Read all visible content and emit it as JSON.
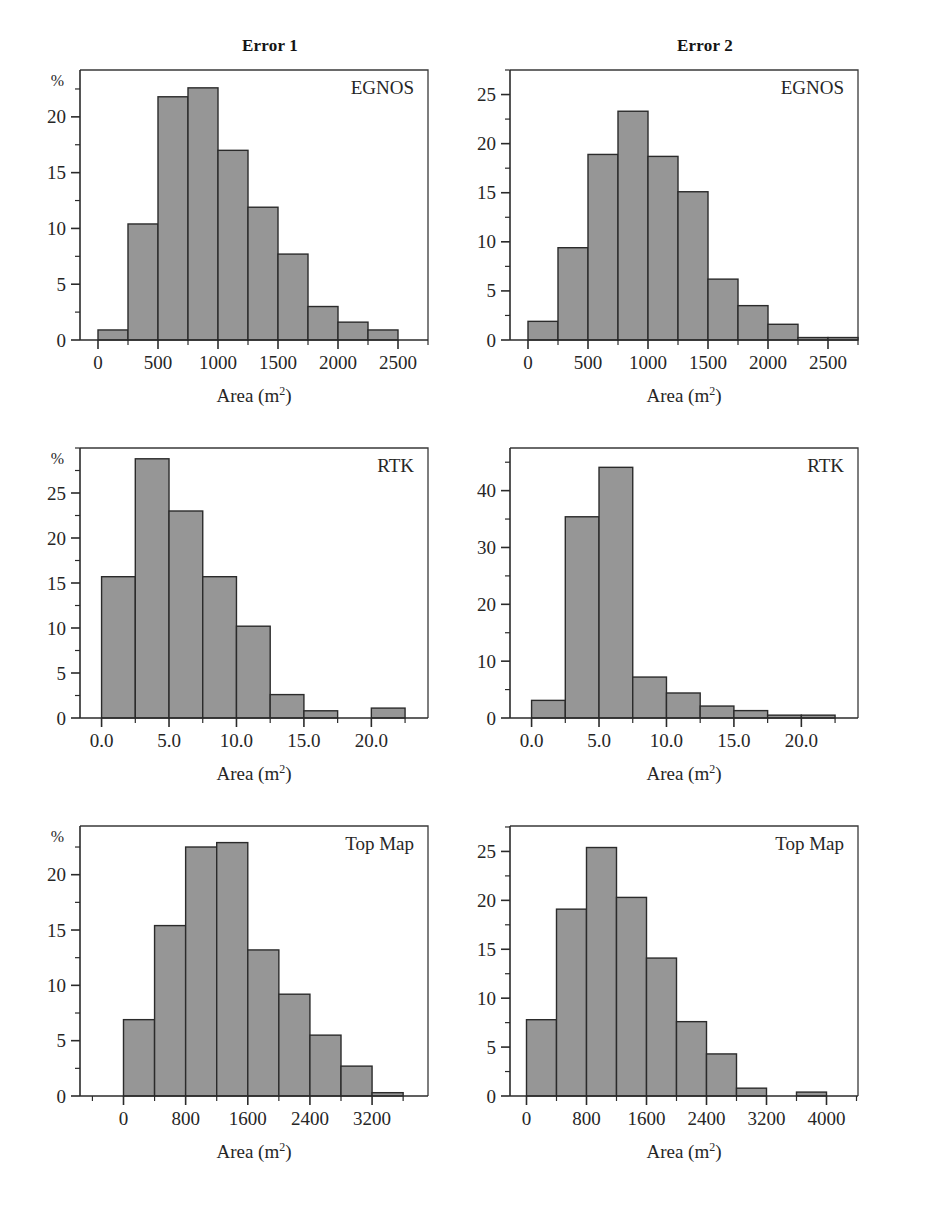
{
  "figure": {
    "column_titles": [
      "Error 1",
      "Error 2"
    ],
    "axis_title_main": "Area (m",
    "axis_title_sup": "2",
    "axis_title_close": ")",
    "percent_symbol": "%",
    "bar_fill_color": "#969696",
    "bar_edge_color": "#2b2b2b",
    "axis_color": "#2b2b2b",
    "background_color": "#ffffff"
  },
  "chart_data": [
    {
      "id": "egnos-error1",
      "type": "bar",
      "title": "Error 1",
      "series_label": "EGNOS",
      "xlabel": "Area (m2)",
      "ylabel": "%",
      "row": 0,
      "col": 0,
      "bin_width": 250,
      "bin_starts": [
        0,
        250,
        500,
        750,
        1000,
        1250,
        1500,
        1750,
        2000,
        2250
      ],
      "values": [
        0.9,
        10.4,
        21.8,
        22.6,
        17.0,
        11.9,
        7.7,
        3.0,
        1.6,
        0.9
      ],
      "xlim": [
        -150,
        2750
      ],
      "ylim": [
        0,
        24.2
      ],
      "xticks": [
        0,
        500,
        1000,
        1500,
        2000,
        2500
      ],
      "xtick_labels": [
        "0",
        "500",
        "1000",
        "1500",
        "2000",
        "2500"
      ],
      "xminor_step": 250,
      "yticks": [
        0,
        5,
        10,
        15,
        20
      ],
      "ytick_labels": [
        "0",
        "5",
        "10",
        "15",
        "20"
      ],
      "yminor_step": 2.5,
      "grid": false
    },
    {
      "id": "egnos-error2",
      "type": "bar",
      "title": "Error 2",
      "series_label": "EGNOS",
      "xlabel": "Area (m2)",
      "ylabel": "",
      "row": 0,
      "col": 1,
      "bin_width": 250,
      "bin_starts": [
        0,
        250,
        500,
        750,
        1000,
        1250,
        1500,
        1750,
        2000,
        2250,
        2500
      ],
      "values": [
        1.9,
        9.4,
        18.9,
        23.3,
        18.7,
        15.1,
        6.2,
        3.5,
        1.6,
        0.25,
        0.25
      ],
      "xlim": [
        -150,
        2750
      ],
      "ylim": [
        0,
        27.5
      ],
      "xticks": [
        0,
        500,
        1000,
        1500,
        2000,
        2500
      ],
      "xtick_labels": [
        "0",
        "500",
        "1000",
        "1500",
        "2000",
        "2500"
      ],
      "xminor_step": 250,
      "yticks": [
        0,
        5,
        10,
        15,
        20,
        25
      ],
      "ytick_labels": [
        "0",
        "5",
        "10",
        "15",
        "20",
        "25"
      ],
      "yminor_step": 2.5,
      "grid": false
    },
    {
      "id": "rtk-error1",
      "type": "bar",
      "title": "Error 1",
      "series_label": "RTK",
      "xlabel": "Area (m2)",
      "ylabel": "%",
      "row": 1,
      "col": 0,
      "bin_width": 2.5,
      "bin_starts": [
        0,
        2.5,
        5,
        7.5,
        10,
        12.5,
        15,
        20
      ],
      "values": [
        15.7,
        28.8,
        23.0,
        15.7,
        10.2,
        2.6,
        0.8,
        1.1
      ],
      "xlim": [
        -1.6,
        24.2
      ],
      "ylim": [
        0,
        30.0
      ],
      "xticks": [
        0,
        5,
        10,
        15,
        20
      ],
      "xtick_labels": [
        "0.0",
        "5.0",
        "10.0",
        "15.0",
        "20.0"
      ],
      "xminor_step": 2.5,
      "yticks": [
        0,
        5,
        10,
        15,
        20,
        25
      ],
      "ytick_labels": [
        "0",
        "5",
        "10",
        "15",
        "20",
        "25"
      ],
      "yminor_step": 2.5,
      "grid": false
    },
    {
      "id": "rtk-error2",
      "type": "bar",
      "title": "Error 2",
      "series_label": "RTK",
      "xlabel": "Area (m2)",
      "ylabel": "",
      "row": 1,
      "col": 1,
      "bin_width": 2.5,
      "bin_starts": [
        0,
        2.5,
        5,
        7.5,
        10,
        12.5,
        15,
        17.5,
        20
      ],
      "values": [
        3.1,
        35.4,
        44.1,
        7.2,
        4.4,
        2.1,
        1.3,
        0.5,
        0.5
      ],
      "xlim": [
        -1.6,
        24.2
      ],
      "ylim": [
        0,
        47.5
      ],
      "xticks": [
        0,
        5,
        10,
        15,
        20
      ],
      "xtick_labels": [
        "0.0",
        "5.0",
        "10.0",
        "15.0",
        "20.0"
      ],
      "xminor_step": 2.5,
      "yticks": [
        0,
        10,
        20,
        30,
        40
      ],
      "ytick_labels": [
        "0",
        "10",
        "20",
        "30",
        "40"
      ],
      "yminor_step": 5,
      "grid": false
    },
    {
      "id": "topmap-error1",
      "type": "bar",
      "title": "Error 1",
      "series_label": "Top Map",
      "xlabel": "Area (m2)",
      "ylabel": "%",
      "row": 2,
      "col": 0,
      "bin_width": 400,
      "bin_starts": [
        0,
        400,
        800,
        1200,
        1600,
        2000,
        2400,
        2800,
        3200
      ],
      "values": [
        6.9,
        15.4,
        22.5,
        22.9,
        13.2,
        9.2,
        5.5,
        2.7,
        0.3
      ],
      "xlim": [
        -560,
        3920
      ],
      "ylim": [
        0,
        24.4
      ],
      "xticks": [
        0,
        800,
        1600,
        2400,
        3200
      ],
      "xtick_labels": [
        "0",
        "800",
        "1600",
        "2400",
        "3200"
      ],
      "xminor_step": 400,
      "yticks": [
        0,
        5,
        10,
        15,
        20
      ],
      "ytick_labels": [
        "0",
        "5",
        "10",
        "15",
        "20"
      ],
      "yminor_step": 2.5,
      "grid": false
    },
    {
      "id": "topmap-error2",
      "type": "bar",
      "title": "Error 2",
      "series_label": "Top Map",
      "xlabel": "Area (m2)",
      "ylabel": "",
      "row": 2,
      "col": 1,
      "bin_width": 400,
      "bin_starts": [
        0,
        400,
        800,
        1200,
        1600,
        2000,
        2400,
        2800,
        3600
      ],
      "values": [
        7.8,
        19.1,
        25.4,
        20.3,
        14.1,
        7.6,
        4.3,
        0.8,
        0.4
      ],
      "xlim": [
        -220,
        4420
      ],
      "ylim": [
        0,
        27.6
      ],
      "xticks": [
        0,
        800,
        1600,
        2400,
        3200,
        4000
      ],
      "xtick_labels": [
        "0",
        "800",
        "1600",
        "2400",
        "3200",
        "4000"
      ],
      "xminor_step": 400,
      "yticks": [
        0,
        5,
        10,
        15,
        20,
        25
      ],
      "ytick_labels": [
        "0",
        "5",
        "10",
        "15",
        "20",
        "25"
      ],
      "yminor_step": 2.5,
      "grid": false
    }
  ]
}
